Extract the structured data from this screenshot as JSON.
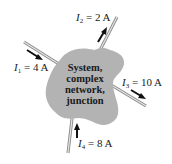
{
  "diagram": {
    "node": {
      "label_lines": [
        "System,",
        "complex",
        "network,",
        "junction"
      ],
      "fill": "#b3b3b3"
    },
    "currents": [
      {
        "symbol": "I",
        "subscript": "1",
        "equals": "= 4 A",
        "direction": "into node"
      },
      {
        "symbol": "I",
        "subscript": "2",
        "equals": "= 2 A",
        "direction": "out of node"
      },
      {
        "symbol": "I",
        "subscript": "3",
        "equals": "= 10 A",
        "direction": "out of node"
      },
      {
        "symbol": "I",
        "subscript": "4",
        "equals": "= 8 A",
        "direction": "into node"
      }
    ],
    "colors": {
      "wire": "#c8c8c8",
      "wire_edge": "#8a8a8a",
      "arrow": "#111111",
      "text": "#1a1a1a"
    }
  }
}
